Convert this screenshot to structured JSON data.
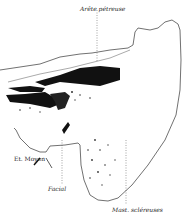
{
  "figure": {
    "type": "anatomical-section-drawing",
    "labels": {
      "top": "Arête pétreuse",
      "left": "Et. Moyen",
      "bottom_left": "Facial",
      "bottom_right": "Mast. scléreuses"
    }
  }
}
